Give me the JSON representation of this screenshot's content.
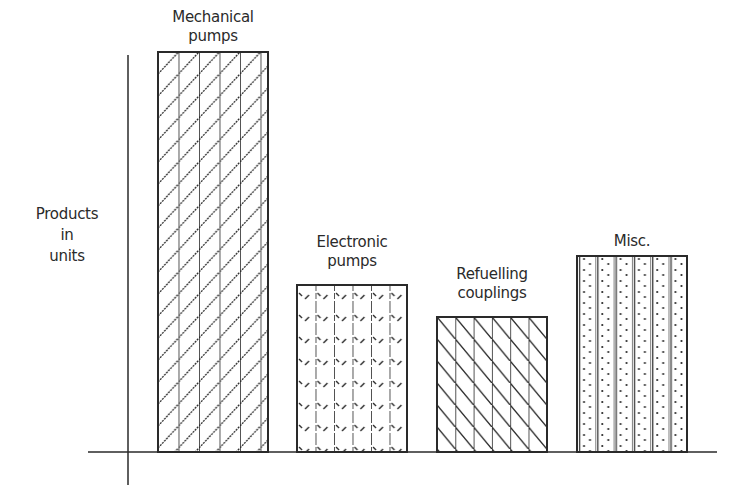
{
  "chart_data": {
    "type": "bar",
    "title": "",
    "xlabel": "",
    "ylabel": "Products\nin\nunits",
    "categories": [
      "Mechanical\npumps",
      "Electronic\npumps",
      "Refuelling\ncouplings",
      "Misc."
    ],
    "values": [
      400,
      167,
      135,
      196
    ],
    "value_units": "relative (no numeric scale shown)",
    "ylim": [
      0,
      400
    ],
    "grid": false,
    "legend": null,
    "patterns": [
      "vertical-lines + forward-diagonal hatch",
      "vertical-lines + short dashes",
      "vertical-lines + backward-diagonal hatch",
      "vertical-lines + dots"
    ]
  },
  "colors": {
    "ink": "#2a2a2a",
    "fill": "#ffffff"
  }
}
